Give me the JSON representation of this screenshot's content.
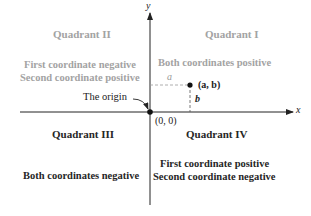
{
  "axes": {
    "x_label": "x",
    "y_label": "y"
  },
  "origin": {
    "label": "(0, 0)",
    "callout": "The origin"
  },
  "point": {
    "label": "(a, b)",
    "horizontal_label": "a",
    "vertical_label": "b"
  },
  "quadrants": [
    {
      "title": "Quadrant I",
      "lines": [
        "Both coordinates positive"
      ]
    },
    {
      "title": "Quadrant II",
      "lines": [
        "First coordinate negative",
        "Second coordinate positive"
      ]
    },
    {
      "title": "Quadrant III",
      "lines": [
        "Both coordinates negative"
      ]
    },
    {
      "title": "Quadrant IV",
      "lines": [
        "First coordinate positive",
        "Second coordinate negative"
      ]
    }
  ],
  "colors": {
    "highlight_text": "#a3a3a3",
    "normal_text": "#262626",
    "axis": "#222222"
  }
}
